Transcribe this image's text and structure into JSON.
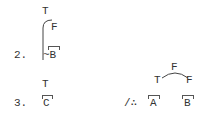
{
  "items": [
    {
      "number": "2.",
      "top_label": "T",
      "branch_label": "F",
      "bottom_label": "~B"
    },
    {
      "number": "3.",
      "top_label": "T",
      "bottom_label": "C"
    }
  ],
  "conclusion": {
    "prefix": "/∴",
    "tree_top": "F",
    "tree_left": "T",
    "tree_right": "F",
    "left_label": "A",
    "right_label": "B"
  }
}
